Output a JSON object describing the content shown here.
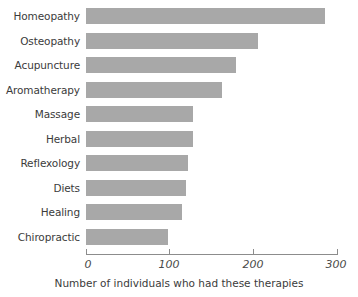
{
  "chart_data": {
    "type": "bar",
    "orientation": "horizontal",
    "title": "",
    "subtitle": "",
    "xlabel": "Number of individuals who had these therapies",
    "ylabel": "",
    "categories": [
      "Homeopathy",
      "Osteopathy",
      "Acupuncture",
      "Aromatherapy",
      "Massage",
      "Herbal",
      "Reflexology",
      "Diets",
      "Healing",
      "Chiropractic"
    ],
    "values": [
      286,
      206,
      179,
      162,
      128,
      128,
      122,
      119,
      115,
      98
    ],
    "xlim": [
      0,
      300
    ],
    "xticks": [
      0,
      100,
      200,
      300
    ],
    "xtick_labels": [
      "0",
      "100",
      "200",
      "300"
    ],
    "grid": false,
    "legend": false,
    "bar_color": "#a8a8a8",
    "axis_color": "#8c8c8c",
    "text_color": "#3b3b3b"
  }
}
